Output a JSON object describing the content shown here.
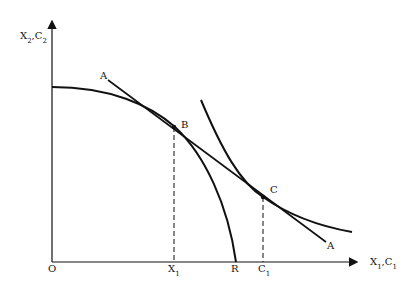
{
  "diagram": {
    "type": "economics-ppf-indifference",
    "axes": {
      "y_label": {
        "main": "X",
        "sub": "2",
        "sep": ",",
        "main2": "C",
        "sub2": "2"
      },
      "x_label": {
        "main": "X",
        "sub": "1",
        "sep": ",",
        "main2": "C",
        "sub2": "1"
      },
      "origin": "O"
    },
    "points": {
      "B": "B",
      "C": "C"
    },
    "line_labels": {
      "price_line_top": "A",
      "price_line_bottom": "A"
    },
    "x_ticks": {
      "x1": {
        "main": "X",
        "sub": "1"
      },
      "r": "R",
      "c1": {
        "main": "C",
        "sub": "1"
      }
    },
    "colors": {
      "ink": "#111111",
      "background": "#ffffff"
    }
  }
}
